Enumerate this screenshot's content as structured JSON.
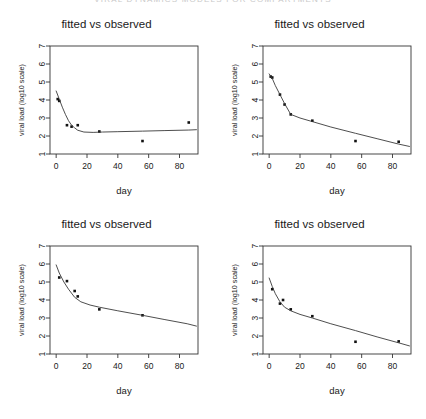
{
  "page_header": "VIRAL DYNAMICS MODELS FOR COMPARTMENTS",
  "panels": [
    {
      "id": "panel-top-left",
      "title": "fitted vs observed",
      "chart_data": {
        "type": "scatter",
        "title": "fitted vs observed",
        "xlabel": "day",
        "ylabel": "viral load (log10 scale)",
        "xlim": [
          -4,
          92
        ],
        "ylim": [
          1,
          7
        ],
        "xticks": [
          0,
          20,
          40,
          60,
          80
        ],
        "yticks": [
          1,
          2,
          3,
          4,
          5,
          6,
          7
        ],
        "grid": false,
        "legend": "none",
        "series": [
          {
            "name": "observed",
            "type": "scatter",
            "x": [
              1,
              2,
              7,
              10,
              14,
              28,
              56,
              86
            ],
            "y": [
              4.05,
              3.95,
              2.6,
              2.52,
              2.6,
              2.25,
              1.72,
              2.75
            ]
          },
          {
            "name": "fitted",
            "type": "line",
            "x": [
              0,
              2,
              4,
              6,
              8,
              10,
              12,
              14,
              18,
              24,
              30,
              40,
              56,
              70,
              86,
              91
            ],
            "y": [
              4.5,
              4.05,
              3.6,
              3.2,
              2.85,
              2.6,
              2.45,
              2.32,
              2.22,
              2.2,
              2.22,
              2.24,
              2.27,
              2.3,
              2.33,
              2.35
            ]
          }
        ]
      }
    },
    {
      "id": "panel-top-right",
      "title": "fitted vs observed",
      "chart_data": {
        "type": "scatter",
        "title": "fitted vs observed",
        "xlabel": "day",
        "ylabel": "viral load (log10 scale)",
        "xlim": [
          -4,
          92
        ],
        "ylim": [
          1,
          7
        ],
        "xticks": [
          0,
          20,
          40,
          60,
          80
        ],
        "yticks": [
          1,
          2,
          3,
          4,
          5,
          6,
          7
        ],
        "grid": false,
        "legend": "none",
        "series": [
          {
            "name": "observed",
            "type": "scatter",
            "x": [
              1,
              2,
              7,
              10,
              14,
              28,
              56,
              84
            ],
            "y": [
              5.3,
              5.25,
              4.3,
              3.75,
              3.2,
              2.85,
              1.72,
              1.68
            ]
          },
          {
            "name": "fitted",
            "type": "line",
            "x": [
              0,
              2,
              4,
              7,
              10,
              14,
              20,
              28,
              40,
              56,
              70,
              84,
              91
            ],
            "y": [
              5.45,
              5.2,
              4.8,
              4.3,
              3.8,
              3.2,
              3.0,
              2.8,
              2.5,
              2.15,
              1.85,
              1.55,
              1.42
            ]
          }
        ]
      }
    },
    {
      "id": "panel-bottom-left",
      "title": "fitted vs observed",
      "chart_data": {
        "type": "scatter",
        "title": "fitted vs observed",
        "xlabel": "day",
        "ylabel": "viral load (log10 scale)",
        "xlim": [
          -4,
          92
        ],
        "ylim": [
          1,
          7
        ],
        "xticks": [
          0,
          20,
          40,
          60,
          80
        ],
        "yticks": [
          1,
          2,
          3,
          4,
          5,
          6,
          7
        ],
        "grid": false,
        "legend": "none",
        "series": [
          {
            "name": "observed",
            "type": "scatter",
            "x": [
              2,
              7,
              12,
              14,
              28,
              56
            ],
            "y": [
              5.25,
              5.05,
              4.5,
              4.2,
              3.48,
              3.15
            ]
          },
          {
            "name": "fitted",
            "type": "line",
            "x": [
              0,
              2,
              5,
              8,
              12,
              16,
              22,
              28,
              40,
              56,
              70,
              85,
              91
            ],
            "y": [
              5.95,
              5.5,
              5.0,
              4.6,
              4.15,
              3.9,
              3.72,
              3.6,
              3.4,
              3.15,
              2.92,
              2.68,
              2.55
            ]
          }
        ]
      }
    },
    {
      "id": "panel-bottom-right",
      "title": "fitted vs observed",
      "chart_data": {
        "type": "scatter",
        "title": "fitted vs observed",
        "xlabel": "day",
        "ylabel": "viral load (log10 scale)",
        "xlim": [
          -4,
          92
        ],
        "ylim": [
          1,
          7
        ],
        "xticks": [
          0,
          20,
          40,
          60,
          80
        ],
        "yticks": [
          1,
          2,
          3,
          4,
          5,
          6,
          7
        ],
        "grid": false,
        "legend": "none",
        "series": [
          {
            "name": "observed",
            "type": "scatter",
            "x": [
              2,
              7,
              9,
              14,
              28,
              56,
              84
            ],
            "y": [
              4.6,
              3.8,
              4.0,
              3.48,
              3.1,
              1.68,
              1.7
            ]
          },
          {
            "name": "fitted",
            "type": "line",
            "x": [
              0,
              2,
              4,
              7,
              10,
              14,
              20,
              28,
              40,
              56,
              70,
              84,
              91
            ],
            "y": [
              5.22,
              4.75,
              4.35,
              3.9,
              3.6,
              3.4,
              3.2,
              3.0,
              2.68,
              2.3,
              1.95,
              1.62,
              1.45
            ]
          }
        ]
      }
    }
  ],
  "colors": {
    "axis": "#333333",
    "line": "#3a3a3a",
    "point": "#111111",
    "text": "#1a1a1a",
    "background": "#ffffff"
  }
}
